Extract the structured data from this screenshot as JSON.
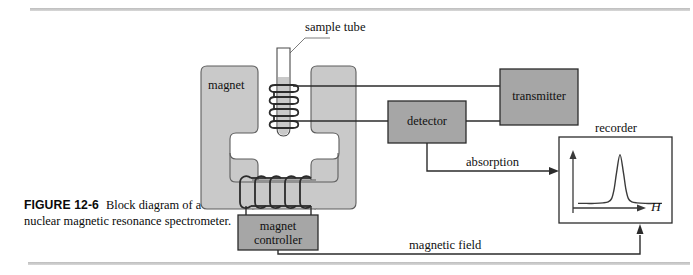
{
  "figure": {
    "caption_number": "FIGURE 12-6",
    "caption_lead": "Block",
    "caption_rest": "diagram of a nuclear magnetic resonance spectrometer."
  },
  "labels": {
    "sample_tube": "sample tube",
    "magnet": "magnet",
    "magnet_controller_line1": "magnet",
    "magnet_controller_line2": "controller",
    "detector": "detector",
    "transmitter": "transmitter",
    "recorder": "recorder",
    "absorption": "absorption",
    "magnetic_field": "magnetic field",
    "axis_h": "H"
  },
  "colors": {
    "magnet_fill": "#c9c9c9",
    "block_fill": "#a6a6a6",
    "tube_fill": "#d0d0d0",
    "stroke": "#3a3a3a",
    "rule": "#c4c4c4",
    "page_bg": "#ffffff"
  },
  "chart_data": {
    "type": "line",
    "title": "recorder",
    "xlabel": "H",
    "ylabel": "absorption",
    "grid": false,
    "legend": null,
    "x": [
      0,
      10,
      20,
      30,
      36,
      40,
      43,
      46,
      50,
      54,
      57,
      60,
      64,
      70,
      80,
      90,
      100
    ],
    "y": [
      3,
      3,
      3,
      4,
      6,
      12,
      30,
      62,
      95,
      62,
      30,
      12,
      6,
      4,
      3,
      3,
      3
    ],
    "xlim": [
      0,
      100
    ],
    "ylim": [
      0,
      100
    ],
    "peak_center": 50,
    "peak_height": 95
  }
}
